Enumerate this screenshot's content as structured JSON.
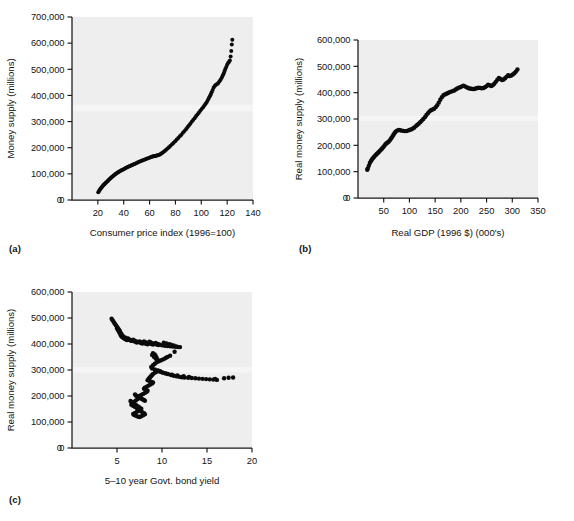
{
  "figure": {
    "background_color": "#ffffff",
    "plot_area_color": "#eeeeee",
    "marker_color": "#0b0b0b",
    "axis_color": "#171717",
    "panel_labels": [
      "(a)",
      "(b)",
      "(c)"
    ]
  },
  "chart_data": [
    {
      "type": "scatter",
      "panel": "(a)",
      "title": "",
      "xlabel": "Consumer price index (1996=100)",
      "ylabel": "Money supply (millions)",
      "xlim": [
        0,
        140
      ],
      "ylim": [
        0,
        700000
      ],
      "xticks": [
        0,
        20,
        40,
        60,
        80,
        100,
        120,
        140
      ],
      "xtick_labels": [
        "0",
        "20",
        "40",
        "60",
        "80",
        "100",
        "120",
        "140"
      ],
      "yticks": [
        0,
        100000,
        200000,
        300000,
        400000,
        500000,
        600000,
        700000
      ],
      "ytick_labels": [
        "0",
        "100,000",
        "200,000",
        "300,000",
        "400,000",
        "500,000",
        "600,000",
        "700,000"
      ],
      "grid": false,
      "legend": "none",
      "x": [
        20.3,
        20.9,
        21.4,
        21.9,
        22.5,
        23.0,
        23.6,
        24.2,
        24.8,
        25.4,
        26.0,
        26.6,
        27.2,
        27.8,
        28.5,
        29.1,
        29.8,
        30.4,
        31.1,
        31.8,
        32.5,
        33.2,
        33.9,
        34.6,
        35.3,
        36.1,
        36.8,
        37.6,
        38.3,
        39.1,
        39.9,
        40.7,
        41.5,
        42.3,
        43.1,
        44.0,
        44.8,
        45.7,
        46.5,
        47.4,
        48.3,
        49.2,
        50.1,
        51.0,
        52.0,
        52.9,
        53.9,
        54.8,
        55.8,
        56.8,
        57.8,
        58.8,
        59.8,
        60.8,
        61.6,
        62.3,
        63.0,
        63.6,
        64.2,
        64.9,
        65.6,
        66.3,
        67.1,
        67.9,
        68.8,
        69.7,
        70.7,
        71.7,
        72.8,
        73.9,
        75.0,
        76.2,
        77.4,
        78.6,
        79.8,
        81.0,
        82.2,
        83.4,
        84.6,
        85.8,
        87.0,
        88.2,
        89.3,
        90.4,
        91.5,
        92.6,
        93.7,
        94.8,
        95.9,
        97.0,
        98.1,
        99.2,
        100.3,
        101.4,
        102.5,
        103.5,
        104.4,
        105.2,
        105.9,
        106.6,
        107.3,
        108.0,
        108.8,
        109.6,
        110.5,
        111.4,
        112.3,
        113.2,
        114.1,
        115.0,
        115.9,
        116.7,
        117.4,
        118.0,
        118.6,
        119.3,
        120.0,
        120.7,
        121.4,
        122.1,
        122.7,
        123.2,
        123.6,
        124.0
      ],
      "y": [
        30000,
        34000,
        38000,
        42000,
        45500,
        49000,
        52500,
        56000,
        59000,
        62000,
        65000,
        68000,
        71000,
        74000,
        77000,
        80000,
        83000,
        86000,
        89000,
        92000,
        95000,
        97500,
        100000,
        102500,
        105000,
        107500,
        110000,
        112000,
        114000,
        116000,
        118000,
        120000,
        122000,
        124000,
        126000,
        128000,
        130000,
        132000,
        134000,
        136000,
        138000,
        140000,
        142000,
        144000,
        146000,
        148000,
        150000,
        152000,
        154000,
        156000,
        158000,
        160000,
        162000,
        163500,
        165000,
        166000,
        167000,
        167800,
        168500,
        169200,
        170000,
        171000,
        172500,
        174500,
        177000,
        180000,
        183500,
        187500,
        192000,
        197000,
        202000,
        207500,
        213000,
        219000,
        225000,
        231000,
        237000,
        243500,
        250000,
        257000,
        264000,
        271000,
        278000,
        285000,
        292000,
        299000,
        306000,
        313000,
        320000,
        327000,
        334000,
        341000,
        348000,
        355000,
        362000,
        369000,
        376000,
        383000,
        390000,
        397000,
        404000,
        412000,
        421000,
        430000,
        437000,
        441000,
        444000,
        448000,
        454000,
        461000,
        469000,
        477000,
        485000,
        493000,
        501000,
        509000,
        517000,
        524000,
        528000,
        534000,
        549000,
        570000,
        595000,
        613000
      ]
    },
    {
      "type": "scatter",
      "panel": "(b)",
      "title": "",
      "xlabel": "Real GDP (1996 $) (000's)",
      "ylabel": "Real money supply (millions)",
      "xlim": [
        0,
        350
      ],
      "ylim": [
        0,
        600000
      ],
      "xticks": [
        0,
        50,
        100,
        150,
        200,
        250,
        300,
        350
      ],
      "xtick_labels": [
        "0",
        "50",
        "100",
        "150",
        "200",
        "250",
        "300",
        "350"
      ],
      "yticks": [
        0,
        100000,
        200000,
        300000,
        400000,
        500000,
        600000
      ],
      "ytick_labels": [
        "0",
        "100,000",
        "200,000",
        "300,000",
        "400,000",
        "500,000",
        "600,000"
      ],
      "grid": false,
      "legend": "none",
      "x": [
        18,
        19,
        21,
        23,
        25,
        27,
        29,
        31,
        33,
        35,
        37,
        39,
        41,
        43,
        45,
        47,
        49,
        51,
        53,
        55,
        57,
        59,
        61,
        63,
        65,
        67,
        69,
        71,
        73,
        76,
        79,
        82,
        85,
        88,
        91,
        94,
        97,
        100,
        103,
        106,
        109,
        112,
        115,
        118,
        121,
        124,
        127,
        130,
        133,
        136,
        139,
        142,
        145,
        148,
        151,
        154,
        157,
        160,
        163,
        166,
        169,
        172,
        175,
        178,
        181,
        184,
        187,
        190,
        193,
        196,
        199,
        202,
        205,
        208,
        211,
        214,
        217,
        220,
        223,
        226,
        229,
        232,
        235,
        238,
        241,
        244,
        247,
        250,
        253,
        256,
        259,
        262,
        265,
        268,
        271,
        274,
        277,
        280,
        283,
        286,
        289,
        292,
        295,
        298,
        301,
        304,
        307,
        310
      ],
      "y": [
        107000,
        112000,
        122000,
        133000,
        140000,
        146000,
        151000,
        156000,
        160000,
        164000,
        168000,
        172000,
        176000,
        180000,
        184000,
        188000,
        193000,
        198000,
        203000,
        207000,
        210000,
        213000,
        217000,
        222000,
        228000,
        234000,
        240000,
        246000,
        252000,
        256000,
        258000,
        257000,
        256000,
        255000,
        254000,
        254000,
        256000,
        258000,
        260000,
        263000,
        267000,
        272000,
        277000,
        282000,
        288000,
        294000,
        300000,
        307000,
        315000,
        322000,
        329000,
        333000,
        336000,
        339000,
        345000,
        352000,
        362000,
        373000,
        383000,
        390000,
        393000,
        396000,
        399000,
        402000,
        404000,
        406000,
        408000,
        412000,
        416000,
        419000,
        421000,
        424000,
        426000,
        424000,
        421000,
        418000,
        416000,
        415000,
        414000,
        414000,
        416000,
        418000,
        419000,
        418000,
        417000,
        418000,
        421000,
        425000,
        430000,
        428000,
        425000,
        428000,
        434000,
        441000,
        449000,
        456000,
        452000,
        448000,
        450000,
        455000,
        461000,
        466000,
        463000,
        465000,
        469000,
        474000,
        480000,
        488000
      ]
    },
    {
      "type": "scatter",
      "panel": "(c)",
      "title": "",
      "xlabel": "5–10 year Govt. bond yield",
      "ylabel": "Real money supply (millions)",
      "xlim": [
        0,
        20
      ],
      "ylim": [
        0,
        600000
      ],
      "xticks": [
        0,
        5,
        10,
        15,
        20
      ],
      "xtick_labels": [
        "0",
        "5",
        "10",
        "15",
        "20"
      ],
      "yticks": [
        0,
        100000,
        200000,
        300000,
        400000,
        500000,
        600000
      ],
      "ytick_labels": [
        "0",
        "100,000",
        "200,000",
        "300,000",
        "400,000",
        "500,000",
        "600,000"
      ],
      "grid": false,
      "legend": "none",
      "x": [
        4.4,
        4.5,
        4.6,
        4.7,
        4.8,
        4.9,
        5.0,
        5.1,
        5.2,
        5.3,
        5.1,
        5.0,
        5.2,
        5.4,
        5.5,
        5.6,
        5.4,
        5.3,
        5.5,
        5.7,
        5.8,
        5.6,
        5.5,
        5.7,
        5.9,
        6.1,
        6.0,
        5.8,
        5.6,
        5.5,
        5.4,
        5.6,
        5.9,
        6.2,
        6.4,
        6.6,
        6.5,
        6.3,
        6.2,
        6.4,
        6.7,
        7.0,
        7.2,
        7.1,
        6.9,
        6.8,
        7.0,
        7.3,
        7.6,
        7.8,
        7.7,
        7.5,
        7.6,
        7.9,
        8.2,
        8.4,
        8.3,
        8.1,
        8.0,
        8.2,
        8.5,
        8.8,
        9.0,
        8.9,
        8.7,
        8.6,
        8.8,
        9.1,
        9.4,
        9.6,
        9.5,
        9.3,
        9.7,
        10.0,
        10.3,
        10.6,
        10.9,
        11.2,
        11.5,
        11.8,
        11.6,
        11.3,
        11.0,
        10.8,
        10.5,
        10.2,
        11.4,
        12.0,
        10.9,
        10.6,
        10.4,
        10.2,
        10.0,
        9.8,
        9.6,
        9.5,
        9.4,
        9.3,
        9.2,
        9.0,
        8.9,
        9.1,
        9.3,
        9.5,
        9.4,
        9.2,
        9.0,
        8.8,
        8.9,
        9.2,
        9.5,
        9.8,
        10.1,
        10.4,
        10.7,
        11.0,
        11.3,
        11.6,
        11.9,
        12.2,
        12.5,
        12.9,
        13.3,
        13.7,
        14.1,
        14.5,
        14.9,
        15.3,
        15.7,
        16.1,
        16.9,
        17.4,
        17.9,
        15.9,
        13.0,
        12.4,
        11.7,
        11.1,
        10.6,
        10.3,
        10.0,
        9.8,
        9.6,
        9.4,
        9.2,
        9.0,
        8.9,
        8.8,
        8.7,
        8.6,
        8.5,
        8.4,
        8.6,
        8.8,
        9.0,
        8.9,
        8.7,
        8.5,
        8.3,
        8.1,
        8.0,
        8.2,
        8.4,
        8.3,
        8.1,
        7.9,
        7.7,
        7.5,
        7.4,
        7.6,
        7.8,
        8.0,
        8.1,
        7.9,
        7.7,
        7.5,
        7.3,
        7.1,
        7.0,
        7.2,
        7.4,
        7.3,
        7.1,
        6.9,
        6.8,
        6.7,
        6.6,
        6.8,
        7.0,
        7.2,
        7.4,
        7.6,
        7.5,
        7.3,
        7.1,
        6.9,
        6.7,
        6.6,
        6.5,
        6.7,
        6.9,
        7.1,
        7.3,
        7.5,
        7.7,
        7.6,
        7.4,
        7.2,
        7.0,
        6.8,
        6.9,
        7.1,
        7.3,
        7.5,
        7.7,
        7.9,
        8.1,
        8.0,
        7.8,
        7.6
      ],
      "y": [
        497000,
        492000,
        487000,
        481000,
        476000,
        471000,
        466000,
        461000,
        456000,
        451000,
        455000,
        460000,
        448000,
        443000,
        438000,
        433000,
        437000,
        442000,
        430000,
        426000,
        422000,
        427000,
        432000,
        424000,
        419000,
        415000,
        418000,
        423000,
        428000,
        433000,
        436000,
        431000,
        425000,
        420000,
        416000,
        412000,
        414000,
        418000,
        421000,
        417000,
        413000,
        409000,
        406000,
        410000,
        414000,
        417000,
        412000,
        408000,
        405000,
        402000,
        406000,
        410000,
        407000,
        404000,
        401000,
        399000,
        403000,
        407000,
        410000,
        406000,
        403000,
        400000,
        398000,
        402000,
        406000,
        409000,
        405000,
        401000,
        398000,
        396000,
        400000,
        404000,
        398000,
        395000,
        393000,
        392000,
        391000,
        390000,
        389000,
        388000,
        391000,
        394000,
        397000,
        399000,
        402000,
        405000,
        370000,
        388000,
        355000,
        350000,
        346000,
        342000,
        339000,
        336000,
        333000,
        340000,
        347000,
        354000,
        360000,
        365000,
        358000,
        351000,
        344000,
        338000,
        330000,
        324000,
        318000,
        312000,
        306000,
        302000,
        298000,
        294000,
        290000,
        287000,
        284000,
        281000,
        278000,
        276000,
        274000,
        272000,
        271000,
        270000,
        269000,
        268000,
        267000,
        266000,
        265000,
        264000,
        263000,
        262000,
        268000,
        270000,
        271000,
        266000,
        273000,
        276000,
        279000,
        282000,
        285000,
        288000,
        291000,
        294000,
        297000,
        293000,
        289000,
        285000,
        281000,
        277000,
        273000,
        269000,
        265000,
        261000,
        258000,
        255000,
        252000,
        248000,
        244000,
        240000,
        236000,
        232000,
        228000,
        224000,
        220000,
        216000,
        212000,
        208000,
        204000,
        200000,
        196000,
        192000,
        188000,
        185000,
        182000,
        186000,
        190000,
        194000,
        198000,
        202000,
        206000,
        200000,
        194000,
        188000,
        183000,
        178000,
        174000,
        170000,
        166000,
        162000,
        158000,
        154000,
        150000,
        147000,
        151000,
        156000,
        161000,
        166000,
        171000,
        176000,
        181000,
        176000,
        171000,
        166000,
        161000,
        156000,
        151000,
        147000,
        143000,
        139000,
        135000,
        131000,
        127000,
        124000,
        121000,
        119000,
        122000,
        126000,
        130000,
        134000,
        138000,
        142000
      ]
    }
  ]
}
